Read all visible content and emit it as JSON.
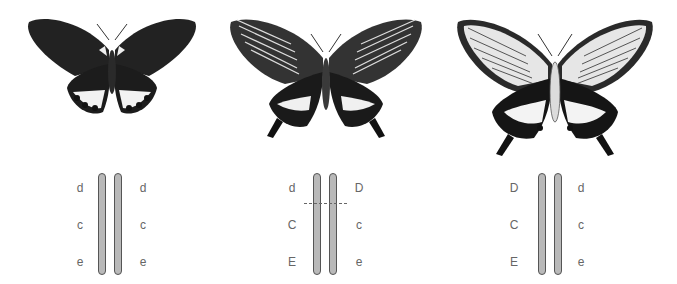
{
  "colors": {
    "wing_dark": "#1a1a1a",
    "wing_light": "#e8e8e8",
    "chromosome_fill": "#b9b9b9",
    "chromosome_outline": "#555555",
    "label": "#666666"
  },
  "panels": [
    {
      "id": "panel-1",
      "butterfly": {
        "morph": "dark forewings, white-spotted hindwings, no tails",
        "icon": "butterfly-dark-icon"
      },
      "chromosomes": {
        "left_alleles": [
          "d",
          "c",
          "e"
        ],
        "right_alleles": [
          "d",
          "c",
          "e"
        ],
        "crossover": false
      }
    },
    {
      "id": "panel-2",
      "butterfly": {
        "morph": "striped forewings, banded tailed hindwings",
        "icon": "butterfly-tailed-icon"
      },
      "chromosomes": {
        "left_alleles": [
          "d",
          "C",
          "E"
        ],
        "right_alleles": [
          "D",
          "c",
          "e"
        ],
        "crossover": true
      }
    },
    {
      "id": "panel-3",
      "butterfly": {
        "morph": "pale striped forewings, white-banded tailed hindwings, pale body",
        "icon": "butterfly-pale-tailed-icon"
      },
      "chromosomes": {
        "left_alleles": [
          "D",
          "C",
          "E"
        ],
        "right_alleles": [
          "d",
          "c",
          "e"
        ],
        "crossover": false
      }
    }
  ]
}
